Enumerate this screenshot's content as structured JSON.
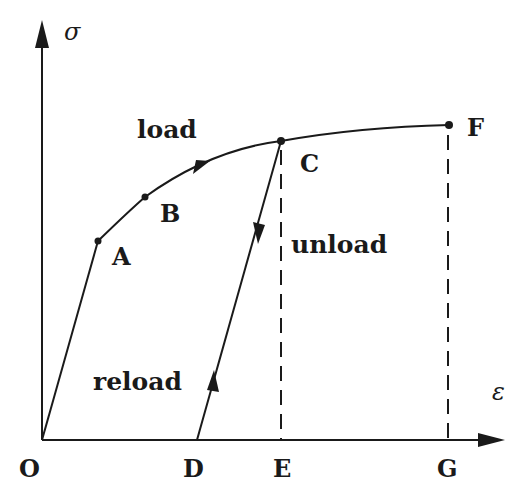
{
  "diagram": {
    "axes": {
      "y_label": "σ",
      "x_label": "ε"
    },
    "points": {
      "O": "O",
      "A": "A",
      "B": "B",
      "C": "C",
      "D": "D",
      "E": "E",
      "F": "F",
      "G": "G"
    },
    "annotations": {
      "load": "load",
      "unload": "unload",
      "reload": "reload"
    },
    "paths": [
      {
        "name": "elastic-segment",
        "from": "O",
        "to": "A"
      },
      {
        "name": "plastic-load-curve",
        "from": "A",
        "through": [
          "B",
          "C"
        ],
        "to": "F"
      },
      {
        "name": "unload-line",
        "from": "C",
        "to": "D"
      },
      {
        "name": "reload-line",
        "from": "D",
        "to": "C"
      },
      {
        "name": "projection-C",
        "from": "C",
        "to": "E",
        "style": "dashed"
      },
      {
        "name": "projection-F",
        "from": "F",
        "to": "G",
        "style": "dashed"
      }
    ],
    "line_color": "#1a1a1a",
    "background": "#ffffff"
  }
}
